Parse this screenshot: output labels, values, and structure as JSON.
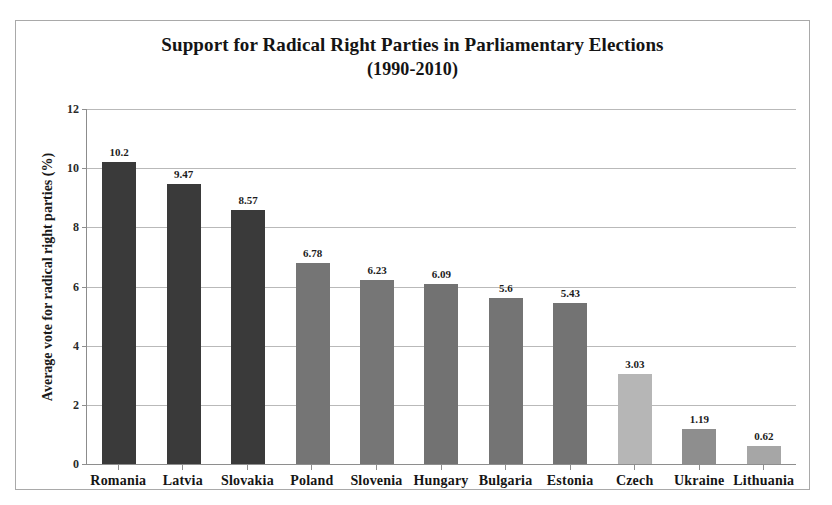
{
  "chart_data": {
    "type": "bar",
    "title": "Support for Radical Right Parties in Parliamentary Elections",
    "subtitle": "(1990-2010)",
    "xlabel": "",
    "ylabel": "Average vote for radical right parties (%)",
    "ylim": [
      0,
      12
    ],
    "yticks": [
      0,
      2,
      4,
      6,
      8,
      10,
      12
    ],
    "ytick_labels": [
      "0",
      "2",
      "4",
      "6",
      "8",
      "10",
      "12"
    ],
    "grid": true,
    "legend": false,
    "categories": [
      "Romania",
      "Latvia",
      "Slovakia",
      "Poland",
      "Slovenia",
      "Hungary",
      "Bulgaria",
      "Estonia",
      "Czech",
      "Ukraine",
      "Lithuania"
    ],
    "values": [
      10.2,
      9.47,
      8.57,
      6.78,
      6.23,
      6.09,
      5.6,
      5.43,
      3.03,
      1.19,
      0.62
    ],
    "value_labels": [
      "10.2",
      "9.47",
      "8.57",
      "6.78",
      "6.23",
      "6.09",
      "5.6",
      "5.43",
      "3.03",
      "1.19",
      "0.62"
    ],
    "bar_colors": [
      "#3a3a3a",
      "#3a3a3a",
      "#3a3a3a",
      "#757575",
      "#767676",
      "#727272",
      "#747474",
      "#737373",
      "#b6b6b6",
      "#8e8e8e",
      "#a6a6a6"
    ]
  },
  "colors": {
    "frame_border": "#a9a9a9",
    "gridline": "#b9b9b9",
    "axis": "#8e8e8e",
    "text": "#151515"
  }
}
